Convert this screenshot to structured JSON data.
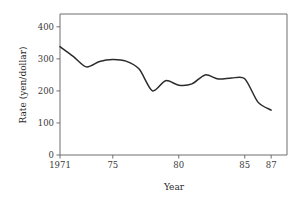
{
  "chart_data": {
    "type": "line",
    "title": "",
    "xlabel": "Year",
    "ylabel": "Rate (yen/dollar)",
    "x": [
      1971,
      1972,
      1973,
      1974,
      1975,
      1976,
      1977,
      1978,
      1979,
      1980,
      1981,
      1982,
      1983,
      1984,
      1985,
      1986,
      1987
    ],
    "values": [
      338,
      308,
      275,
      292,
      298,
      293,
      268,
      200,
      232,
      218,
      222,
      250,
      237,
      240,
      238,
      165,
      140
    ],
    "series": [
      {
        "name": "Exchange rate",
        "values": [
          338,
          308,
          275,
          292,
          298,
          293,
          268,
          200,
          232,
          218,
          222,
          250,
          237,
          240,
          238,
          165,
          140
        ]
      }
    ],
    "xlim": [
      1971,
      1988.2
    ],
    "ylim": [
      0,
      440
    ],
    "xticks": [
      1971,
      1975,
      1980,
      1985,
      1987
    ],
    "xtick_labels": [
      "1971",
      "75",
      "80",
      "85",
      "87"
    ],
    "yticks": [
      0,
      100,
      200,
      300,
      400
    ],
    "ytick_labels": [
      "0",
      "100",
      "200",
      "300",
      "400"
    ],
    "grid": false,
    "legend": false,
    "legend_position": "none",
    "line_color": "#2b2b2b",
    "axis_color": "#6e6e6e",
    "background_color": "#ffffff"
  }
}
